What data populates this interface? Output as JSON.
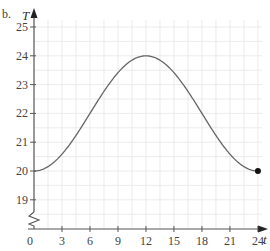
{
  "panel_label": "b.",
  "chart_data": {
    "type": "line",
    "title": "",
    "xlabel": "t",
    "ylabel": "T",
    "xlim": [
      0,
      24.6
    ],
    "ylim": [
      18,
      25.4
    ],
    "x_ticks": [
      0,
      3,
      6,
      9,
      12,
      15,
      18,
      21,
      24
    ],
    "x_tick_labels": [
      "0",
      "3",
      "6",
      "9",
      "12",
      "15",
      "18",
      "21",
      "24"
    ],
    "y_ticks": [
      19,
      20,
      21,
      22,
      23,
      24,
      25
    ],
    "y_tick_labels": [
      "19",
      "20",
      "21",
      "22",
      "23",
      "24",
      "25"
    ],
    "y_axis_break": true,
    "grid": true,
    "minor_grid_step_x": 1.5,
    "minor_grid_step_y": 0.5,
    "legend": null,
    "series": [
      {
        "name": "T(t) = 22 - 2cos(pi t / 12)",
        "x": [
          0,
          1,
          2,
          3,
          4,
          5,
          6,
          7,
          8,
          9,
          10,
          11,
          12,
          13,
          14,
          15,
          16,
          17,
          18,
          19,
          20,
          21,
          22,
          23,
          24
        ],
        "values": [
          20.0,
          20.07,
          20.27,
          20.59,
          21.0,
          21.48,
          22.0,
          22.52,
          23.0,
          23.41,
          23.73,
          23.93,
          24.0,
          23.93,
          23.73,
          23.41,
          23.0,
          22.52,
          22.0,
          21.48,
          21.0,
          20.59,
          20.27,
          20.07,
          20.0
        ],
        "color": "#666666"
      }
    ],
    "annotations": [
      {
        "type": "closed-point",
        "x": 24,
        "y": 20
      }
    ]
  },
  "colors": {
    "axis": "#555555",
    "grid": "#e6e6e6",
    "curve": "#666666",
    "point": "#111111"
  }
}
